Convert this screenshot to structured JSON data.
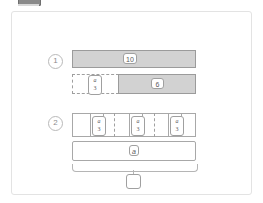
{
  "figure": {
    "colors": {
      "shaded_fill": "#d2d2d2",
      "bar_stroke": "#9b9b9b",
      "panel_border": "#e3e3e3",
      "text": "#5b5b5b",
      "tab": "#8a8a8a"
    },
    "steps": [
      {
        "marker": "1",
        "bars": [
          {
            "name": "total-bar",
            "style": "shaded",
            "label": "10"
          },
          {
            "name": "part-bar",
            "segments": [
              {
                "name": "unknown-part",
                "style": "dashed",
                "label_num": "a",
                "label_den": "3"
              },
              {
                "name": "known-part",
                "style": "shaded",
                "label": "6"
              }
            ]
          }
        ]
      },
      {
        "marker": "2",
        "bars": [
          {
            "name": "thirds-bar",
            "groups": [
              {
                "label_num": "a",
                "label_den": "3"
              },
              {
                "label_num": "a",
                "label_den": "3"
              },
              {
                "label_num": "a",
                "label_den": "3"
              }
            ]
          },
          {
            "name": "whole-bar",
            "label": "a"
          }
        ],
        "brace": {
          "name": "total-brace",
          "answer": ""
        }
      }
    ]
  }
}
